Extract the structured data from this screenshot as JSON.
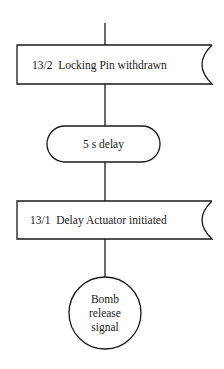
{
  "diagram": {
    "type": "flowchart",
    "nodes": [
      {
        "id": "n1",
        "shape": "event-box",
        "label": "13/2  Locking Pin withdrawn"
      },
      {
        "id": "n2",
        "shape": "terminator",
        "label": "5 s delay"
      },
      {
        "id": "n3",
        "shape": "event-box",
        "label": "13/1  Delay Actuator initiated"
      },
      {
        "id": "n4",
        "shape": "circle",
        "label_lines": [
          "Bomb",
          "release",
          "signal"
        ]
      }
    ],
    "edges": [
      {
        "from": "top",
        "to": "n1"
      },
      {
        "from": "n1",
        "to": "n2"
      },
      {
        "from": "n2",
        "to": "n3"
      },
      {
        "from": "n3",
        "to": "n4"
      }
    ]
  }
}
